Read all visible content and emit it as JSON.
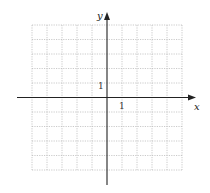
{
  "figure": {
    "type": "coordinate-grid",
    "x_axis_label": "x",
    "y_axis_label": "y",
    "x_tick_label": "1",
    "y_tick_label": "1",
    "grid": {
      "columns": 10,
      "rows": 10,
      "x_range": [
        -5,
        5
      ],
      "y_range": [
        -5,
        5
      ],
      "line_style": "dotted",
      "line_color": "#bdbdbd"
    },
    "axis_color": "#222222"
  }
}
